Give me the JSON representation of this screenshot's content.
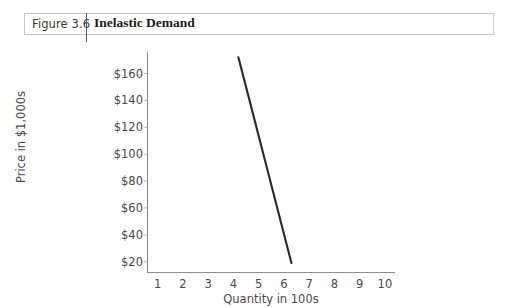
{
  "caption": {
    "figure_number": "Figure 3.6",
    "title": "Inelastic Demand"
  },
  "chart_data": {
    "type": "line",
    "title": "Inelastic Demand",
    "xlabel": "Quantity in 100s",
    "ylabel": "Price in $1,000s",
    "x_tick_labels": [
      "1",
      "2",
      "3",
      "4",
      "5",
      "6",
      "7",
      "8",
      "9",
      "10"
    ],
    "x_ticks": [
      1,
      2,
      3,
      4,
      5,
      6,
      7,
      8,
      9,
      10
    ],
    "y_tick_labels": [
      "$20",
      "$40",
      "$60",
      "$80",
      "$100",
      "$120",
      "$140",
      "$160"
    ],
    "y_ticks": [
      20,
      40,
      60,
      80,
      100,
      120,
      140,
      160
    ],
    "xlim": [
      0.6,
      10.4
    ],
    "ylim": [
      12,
      176
    ],
    "grid": false,
    "legend": null,
    "series": [
      {
        "name": "Demand",
        "color": "#2b2b2b",
        "points": [
          {
            "x": 4.2,
            "y": 172
          },
          {
            "x": 6.3,
            "y": 19
          }
        ]
      }
    ]
  }
}
